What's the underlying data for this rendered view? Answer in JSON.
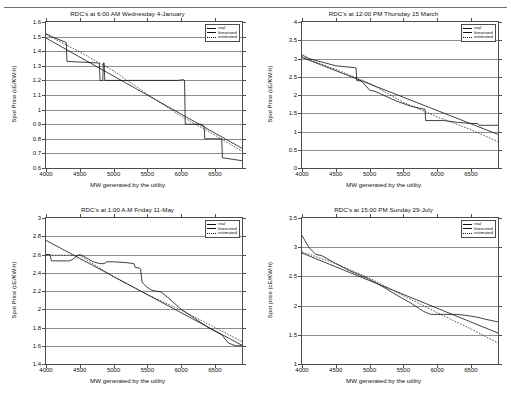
{
  "page": {
    "background": "#ffffff",
    "rule_color": "#6e6e6e"
  },
  "legend": {
    "entries": [
      {
        "label": "real",
        "style": "solid"
      },
      {
        "label": "linearized",
        "style": "solid2"
      },
      {
        "label": "estimated",
        "style": "dot"
      }
    ]
  },
  "common": {
    "xlabel": "MW generated by the utility",
    "xticks": [
      4000,
      4500,
      5000,
      5500,
      6000,
      6500
    ],
    "xlim": [
      4000,
      6900
    ]
  },
  "chart_data": [
    {
      "id": "top-left",
      "type": "line",
      "title": "RDC's at 6:00 AM Wednesday 4-January",
      "xlabel": "MW generated by the utility",
      "ylabel": "Spot Price (cE/KW-h)",
      "xlim": [
        4000,
        6900
      ],
      "ylim": [
        0.6,
        1.6
      ],
      "xticks": [
        4000,
        4500,
        5000,
        5500,
        6000,
        6500
      ],
      "yticks": [
        0.6,
        0.7,
        0.8,
        0.9,
        1,
        1.1,
        1.2,
        1.3,
        1.4,
        1.5,
        1.6
      ],
      "ytick_labels": [
        "0.6",
        "0.7",
        "0.8",
        "0.9",
        "1",
        "1.1",
        "1.2",
        "1.3",
        "1.4",
        "1.5",
        "1.6"
      ],
      "grid": true,
      "legend_position": "top-right",
      "series": [
        {
          "name": "real",
          "points": [
            [
              4000,
              1.52
            ],
            [
              4080,
              1.5
            ],
            [
              4300,
              1.46
            ],
            [
              4310,
              1.33
            ],
            [
              4760,
              1.32
            ],
            [
              4790,
              1.315
            ],
            [
              4800,
              1.2
            ],
            [
              4840,
              1.2
            ],
            [
              4850,
              1.32
            ],
            [
              4860,
              1.32
            ],
            [
              4870,
              1.2
            ],
            [
              5950,
              1.2
            ],
            [
              6030,
              1.205
            ],
            [
              6050,
              1.2
            ],
            [
              6060,
              0.9
            ],
            [
              6300,
              0.9
            ],
            [
              6340,
              0.885
            ],
            [
              6350,
              0.8
            ],
            [
              6560,
              0.8
            ],
            [
              6600,
              0.8
            ],
            [
              6610,
              0.67
            ],
            [
              6900,
              0.65
            ]
          ]
        },
        {
          "name": "linearized",
          "points": [
            [
              4000,
              1.49
            ],
            [
              6900,
              0.735
            ]
          ]
        },
        {
          "name": "estimated",
          "points": [
            [
              4000,
              1.515
            ],
            [
              4500,
              1.395
            ],
            [
              5000,
              1.265
            ],
            [
              5500,
              1.105
            ],
            [
              6000,
              0.955
            ],
            [
              6500,
              0.825
            ],
            [
              6900,
              0.715
            ]
          ]
        }
      ]
    },
    {
      "id": "top-right",
      "type": "line",
      "title": "RDC's at 12:00 PM Thursday 15 March",
      "xlabel": "MW generated by the utility",
      "ylabel": "Spot Price (cE/KW-h)",
      "xlim": [
        4000,
        6900
      ],
      "ylim": [
        0,
        4
      ],
      "xticks": [
        4000,
        4500,
        5000,
        5500,
        6000,
        6500
      ],
      "yticks": [
        0,
        0.5,
        1,
        1.5,
        2,
        2.5,
        3,
        3.5,
        4
      ],
      "ytick_labels": [
        "0",
        "0.5",
        "1",
        "1.5",
        "2",
        "2.5",
        "3",
        "3.5",
        "4"
      ],
      "grid": true,
      "legend_position": "top-right",
      "series": [
        {
          "name": "real",
          "points": [
            [
              4000,
              3.1
            ],
            [
              4100,
              3.0
            ],
            [
              4300,
              2.9
            ],
            [
              4500,
              2.8
            ],
            [
              4780,
              2.75
            ],
            [
              4800,
              2.74
            ],
            [
              4810,
              2.4
            ],
            [
              4880,
              2.38
            ],
            [
              4960,
              2.22
            ],
            [
              5000,
              2.13
            ],
            [
              5080,
              2.1
            ],
            [
              5200,
              2.0
            ],
            [
              5400,
              1.83
            ],
            [
              5600,
              1.7
            ],
            [
              5780,
              1.62
            ],
            [
              5820,
              1.61
            ],
            [
              5830,
              1.3
            ],
            [
              6100,
              1.3
            ],
            [
              6300,
              1.25
            ],
            [
              6500,
              1.22
            ],
            [
              6600,
              1.22
            ],
            [
              6620,
              1.17
            ],
            [
              6900,
              1.17
            ]
          ]
        },
        {
          "name": "linearized",
          "points": [
            [
              4000,
              3.03
            ],
            [
              6900,
              0.92
            ]
          ]
        },
        {
          "name": "estimated",
          "points": [
            [
              4000,
              3.05
            ],
            [
              4500,
              2.7
            ],
            [
              5000,
              2.32
            ],
            [
              5500,
              1.8
            ],
            [
              6000,
              1.4
            ],
            [
              6500,
              1.05
            ],
            [
              6900,
              0.72
            ]
          ]
        }
      ]
    },
    {
      "id": "bottom-left",
      "type": "line",
      "title": "RDC's at 1:00 A.M Friday 11-May",
      "xlabel": "MW generated by the utility",
      "ylabel": "Spot Price (cE/KW-h)",
      "xlim": [
        4000,
        6900
      ],
      "ylim": [
        1.4,
        3
      ],
      "xticks": [
        4000,
        4500,
        5000,
        5500,
        6000,
        6500
      ],
      "yticks": [
        1.4,
        1.6,
        1.8,
        2,
        2.2,
        2.4,
        2.6,
        2.8,
        3
      ],
      "ytick_labels": [
        "1.4",
        "1.6",
        "1.8",
        "2",
        "2.2",
        "2.4",
        "2.6",
        "2.8",
        "3"
      ],
      "grid": true,
      "legend_position": "top-right",
      "series": [
        {
          "name": "real",
          "points": [
            [
              4000,
              2.6
            ],
            [
              4060,
              2.6
            ],
            [
              4080,
              2.53
            ],
            [
              4350,
              2.53
            ],
            [
              4400,
              2.55
            ],
            [
              4450,
              2.58
            ],
            [
              4500,
              2.6
            ],
            [
              4560,
              2.58
            ],
            [
              4700,
              2.52
            ],
            [
              4800,
              2.5
            ],
            [
              4860,
              2.5
            ],
            [
              4900,
              2.52
            ],
            [
              5000,
              2.52
            ],
            [
              5200,
              2.51
            ],
            [
              5300,
              2.5
            ],
            [
              5320,
              2.46
            ],
            [
              5380,
              2.45
            ],
            [
              5400,
              2.44
            ],
            [
              5420,
              2.3
            ],
            [
              5480,
              2.25
            ],
            [
              5560,
              2.21
            ],
            [
              5620,
              2.2
            ],
            [
              5700,
              2.19
            ],
            [
              5800,
              2.13
            ],
            [
              6000,
              2.0
            ],
            [
              6200,
              1.9
            ],
            [
              6400,
              1.8
            ],
            [
              6600,
              1.72
            ],
            [
              6700,
              1.63
            ],
            [
              6800,
              1.6
            ],
            [
              6900,
              1.6
            ]
          ]
        },
        {
          "name": "linearized",
          "points": [
            [
              4000,
              2.755
            ],
            [
              6900,
              1.605
            ]
          ]
        },
        {
          "name": "estimated",
          "points": [
            [
              4000,
              2.595
            ],
            [
              4500,
              2.59
            ],
            [
              5000,
              2.355
            ],
            [
              5500,
              2.16
            ],
            [
              6000,
              1.99
            ],
            [
              6500,
              1.8
            ],
            [
              6900,
              1.645
            ]
          ]
        }
      ]
    },
    {
      "id": "bottom-right",
      "type": "line",
      "title": "RDC's at 15:00 PM Sunday 29-July",
      "xlabel": "MW generated by the utility",
      "ylabel": "Spot price (cE/KW-h)",
      "xlim": [
        4000,
        6900
      ],
      "ylim": [
        1,
        3.5
      ],
      "xticks": [
        4000,
        4500,
        5000,
        5500,
        6000,
        6500
      ],
      "yticks": [
        1,
        1.5,
        2,
        2.5,
        3,
        3.5
      ],
      "ytick_labels": [
        "1",
        "1.5",
        "2",
        "2.5",
        "3",
        "3.5"
      ],
      "grid": true,
      "legend_position": "top-right",
      "series": [
        {
          "name": "real",
          "points": [
            [
              4000,
              3.2
            ],
            [
              4100,
              3.0
            ],
            [
              4200,
              2.88
            ],
            [
              4300,
              2.85
            ],
            [
              4500,
              2.72
            ],
            [
              4700,
              2.6
            ],
            [
              4900,
              2.5
            ],
            [
              5000,
              2.45
            ],
            [
              5200,
              2.32
            ],
            [
              5400,
              2.18
            ],
            [
              5600,
              2.05
            ],
            [
              5800,
              1.9
            ],
            [
              5900,
              1.85
            ],
            [
              6100,
              1.85
            ],
            [
              6300,
              1.85
            ],
            [
              6500,
              1.82
            ],
            [
              6600,
              1.8
            ],
            [
              6700,
              1.77
            ],
            [
              6900,
              1.72
            ]
          ]
        },
        {
          "name": "linearized",
          "points": [
            [
              4000,
              2.9
            ],
            [
              6900,
              1.53
            ]
          ]
        },
        {
          "name": "estimated",
          "points": [
            [
              4000,
              2.92
            ],
            [
              4500,
              2.72
            ],
            [
              5000,
              2.47
            ],
            [
              5500,
              2.17
            ],
            [
              6000,
              1.88
            ],
            [
              6500,
              1.6
            ],
            [
              6900,
              1.36
            ]
          ]
        }
      ]
    }
  ]
}
